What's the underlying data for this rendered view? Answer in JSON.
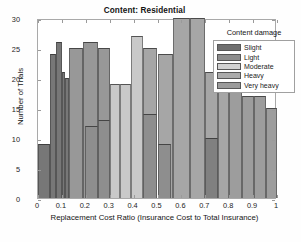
{
  "chart_data": {
    "type": "bar",
    "title": "Content: Residential",
    "xlabel": "Replacement Cost Ratio (Insurance Cost to Total Insurance)",
    "ylabel": "Number of Trials",
    "xlim": [
      0,
      1
    ],
    "ylim": [
      0,
      30
    ],
    "xticks": [
      "0",
      "0.1",
      "0.2",
      "0.3",
      "0.4",
      "0.5",
      "0.6",
      "0.7",
      "0.8",
      "0.9",
      "1"
    ],
    "xtick_values": [
      0,
      0.1,
      0.2,
      0.3,
      0.4,
      0.5,
      0.6,
      0.7,
      0.8,
      0.9,
      1
    ],
    "yticks": [
      "0",
      "5",
      "10",
      "15",
      "20",
      "25",
      "30"
    ],
    "ytick_values": [
      0,
      5,
      10,
      15,
      20,
      25,
      30
    ],
    "grid": false,
    "legend_position": "top-right",
    "legend_title": "Content damage",
    "bin_width": 0.05,
    "series": [
      {
        "name": "Slight",
        "color": "#777777",
        "bins": [
          {
            "x0": 0.0,
            "x1": 0.05,
            "value": 9
          },
          {
            "x0": 0.05,
            "x1": 0.075,
            "value": 24
          },
          {
            "x0": 0.075,
            "x1": 0.1,
            "value": 26
          },
          {
            "x0": 0.1,
            "x1": 0.115,
            "value": 21
          },
          {
            "x0": 0.115,
            "x1": 0.13,
            "value": 20
          }
        ]
      },
      {
        "name": "Light",
        "color": "#989898",
        "bins": [
          {
            "x0": 0.13,
            "x1": 0.19,
            "value": 25
          },
          {
            "x0": 0.19,
            "x1": 0.25,
            "value": 26
          },
          {
            "x0": 0.25,
            "x1": 0.3,
            "value": 25
          }
        ]
      },
      {
        "name": "Moderate",
        "color": "#c9c9c9",
        "bins": [
          {
            "x0": 0.3,
            "x1": 0.345,
            "value": 19
          },
          {
            "x0": 0.345,
            "x1": 0.39,
            "value": 19
          },
          {
            "x0": 0.39,
            "x1": 0.44,
            "value": 27
          }
        ]
      },
      {
        "name": "Heavy",
        "color": "#a6a6a6",
        "bins": [
          {
            "x0": 0.44,
            "x1": 0.5,
            "value": 25
          },
          {
            "x0": 0.5,
            "x1": 0.565,
            "value": 24
          },
          {
            "x0": 0.565,
            "x1": 0.635,
            "value": 30
          },
          {
            "x0": 0.635,
            "x1": 0.7,
            "value": 30
          },
          {
            "x0": 0.7,
            "x1": 0.755,
            "value": 21
          },
          {
            "x0": 0.755,
            "x1": 0.8,
            "value": 19
          }
        ]
      },
      {
        "name": "Very heavy",
        "color": "#9d9d9d",
        "bins": [
          {
            "x0": 0.8,
            "x1": 0.855,
            "value": 22
          },
          {
            "x0": 0.855,
            "x1": 0.905,
            "value": 17
          },
          {
            "x0": 0.905,
            "x1": 0.955,
            "value": 17
          },
          {
            "x0": 0.955,
            "x1": 1.0,
            "value": 15
          }
        ]
      }
    ],
    "overlay_bars": [
      {
        "x0": 0.195,
        "x1": 0.25,
        "value": 12,
        "color": "#8e8e8e"
      },
      {
        "x0": 0.25,
        "x1": 0.3,
        "value": 13,
        "color": "#8e8e8e"
      },
      {
        "x0": 0.44,
        "x1": 0.5,
        "value": 14,
        "color": "#8e8e8e"
      },
      {
        "x0": 0.5,
        "x1": 0.555,
        "value": 9,
        "color": "#8e8e8e"
      },
      {
        "x0": 0.7,
        "x1": 0.755,
        "value": 10,
        "color": "#808080"
      }
    ]
  },
  "legend": {
    "title": "Content damage",
    "entries": [
      {
        "label": "Slight",
        "color": "#6f6f6f"
      },
      {
        "label": "Light",
        "color": "#8d8d8d"
      },
      {
        "label": "Moderate",
        "color": "#d2d2d2"
      },
      {
        "label": "Heavy",
        "color": "#ababab"
      },
      {
        "label": "Very heavy",
        "color": "#9b9b9b"
      }
    ]
  },
  "colors": {
    "axis": "#a9a9a9",
    "text": "#1a1a1a",
    "background": "#ffffff"
  }
}
